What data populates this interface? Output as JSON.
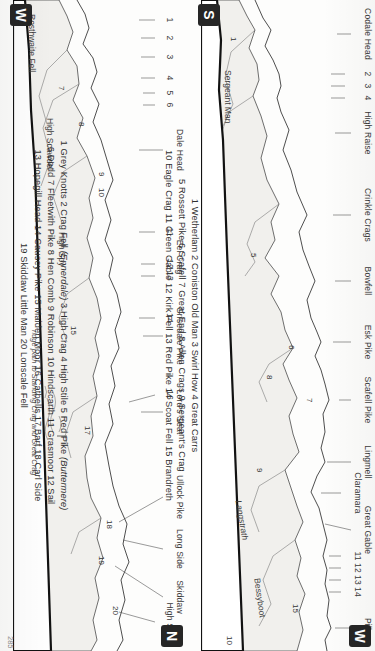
{
  "page": {
    "number": "285",
    "publication_type": "guidebook-panorama-page"
  },
  "compass": {
    "top_left": "W",
    "top_right": "N",
    "bottom_left": "S",
    "bottom_right": "W"
  },
  "panels": [
    {
      "id": "panel-upper",
      "compass_start": "S",
      "compass_end": "W",
      "peak_labels": [
        {
          "name": "Codale Head",
          "x": 34
        },
        {
          "name": "2",
          "x": 74
        },
        {
          "name": "3",
          "x": 86
        },
        {
          "name": "4",
          "x": 98
        },
        {
          "name": "High Raise",
          "x": 133
        },
        {
          "name": "Crinkle Crags",
          "x": 215
        },
        {
          "name": "Bowfell",
          "x": 281
        },
        {
          "name": "Esk Pike",
          "x": 342
        },
        {
          "name": "Scafell Pike",
          "x": 400
        },
        {
          "name": "Lingmell",
          "x": 462
        },
        {
          "name": "Claramara",
          "x": 493
        },
        {
          "name": "Great Gable",
          "x": 530
        },
        {
          "name": "11",
          "x": 556
        },
        {
          "name": "12",
          "x": 568
        },
        {
          "name": "13",
          "x": 580
        },
        {
          "name": "14",
          "x": 592
        },
        {
          "name": "Pillar",
          "x": 628
        }
      ],
      "profile_numbers": [
        {
          "label": "1",
          "x": 37,
          "y": 120
        },
        {
          "label": "5",
          "x": 253,
          "y": 96
        },
        {
          "label": "6",
          "x": 345,
          "y": 60
        },
        {
          "label": "7",
          "x": 398,
          "y": 42
        },
        {
          "label": "8",
          "x": 375,
          "y": 80
        },
        {
          "label": "9",
          "x": 468,
          "y": 90
        },
        {
          "label": "15",
          "x": 608,
          "y": 56
        },
        {
          "label": "10",
          "x": 640,
          "y": 120
        }
      ],
      "profile_names": [
        {
          "name": "Sergeant Man",
          "x": 96,
          "y": 118
        },
        {
          "name": "Langstrath",
          "x": 520,
          "y": 104
        },
        {
          "name": "Bessyboot",
          "x": 583,
          "y": 86
        }
      ],
      "key_lines": [
        "1 Wetherlam  2 Coniston Old Man  3 Swirl How  4 Great Carrs",
        "5 Rossett Pike  6 Scafell  7 Great End  8 Allen Crags  9 Sergeant's Crag",
        "10 Eagle Crag  11 Green Gable  12 Kirk Fell  13 Red Pike  14 Scoat Fell  15 Brandreth"
      ]
    },
    {
      "id": "panel-lower",
      "compass_start": "W",
      "compass_end": "N",
      "peak_labels": [
        {
          "name": "Rosthwaite Fell",
          "x": 40
        },
        {
          "name": "1",
          "x": 20
        },
        {
          "name": "2",
          "x": 38
        },
        {
          "name": "3",
          "x": 57
        },
        {
          "name": "4",
          "x": 78
        },
        {
          "name": "5",
          "x": 93
        },
        {
          "name": "6",
          "x": 105
        },
        {
          "name": "Dale Head",
          "x": 150
        },
        {
          "name": "Eel Crag",
          "x": 257
        },
        {
          "name": "11",
          "x": 232
        },
        {
          "name": "12",
          "x": 262
        },
        {
          "name": "13",
          "x": 272
        },
        {
          "name": "Grisedale Pike",
          "x": 330
        },
        {
          "name": "14",
          "x": 318
        },
        {
          "name": "Lord's Seat",
          "x": 405
        },
        {
          "name": "16",
          "x": 395
        },
        {
          "name": "Ullock Pike",
          "x": 497
        },
        {
          "name": "Long Side",
          "x": 545
        },
        {
          "name": "Skiddaw",
          "x": 592
        },
        {
          "name": "High Seat",
          "x": 612
        }
      ],
      "profile_numbers": [
        {
          "label": "7",
          "x": 86,
          "y": 100
        },
        {
          "label": "8",
          "x": 122,
          "y": 80
        },
        {
          "label": "9",
          "x": 176,
          "y": 62
        },
        {
          "label": "10",
          "x": 190,
          "y": 62
        },
        {
          "label": "17",
          "x": 430,
          "y": 74
        },
        {
          "label": "15",
          "x": 330,
          "y": 88
        },
        {
          "label": "18",
          "x": 525,
          "y": 52
        },
        {
          "label": "19",
          "x": 560,
          "y": 60
        },
        {
          "label": "20",
          "x": 610,
          "y": 46
        }
      ],
      "profile_names": [
        {
          "name": "Rosthwaite Fell",
          "x": 40,
          "y": 126
        },
        {
          "name": "High Scawdel",
          "x": 130,
          "y": 106
        },
        {
          "name": "High Spy",
          "x": 240,
          "y": 92
        }
      ],
      "annotation": "ridge path to Standing Crag and Great Crag",
      "key_lines": [
        "1 Grey Knotts  2 Crag Fell (Ennerdale)  3 High Crag  4 High Stile  5 Red Pike (Buttermere)",
        "6 Dodd  7 Fleetwith Pike  8 Hen Comb  9 Robinson  10 Hindscarth  11 Grasmoor  12 Sail",
        "13 Hopegill Head  14 Causey Pike  15 Maiden Moor  16 Catbells  17 Barf  18 Carl Side",
        "19 Skiddaw Little Man  20 Lonscale Fell"
      ]
    }
  ],
  "colors": {
    "ink": "#2b2b2b",
    "paper": "#fdfdfc",
    "fill": "#f0efec",
    "badge": "#262626"
  }
}
